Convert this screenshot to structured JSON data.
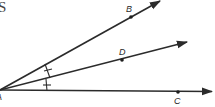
{
  "heading_fragment": "S",
  "vertex": {
    "label": "A",
    "x": 0,
    "y": 90
  },
  "rays": [
    {
      "name": "ray-AB",
      "point": {
        "label": "B",
        "x": 131,
        "y": 17
      },
      "end": {
        "x": 160,
        "y": 0
      }
    },
    {
      "name": "ray-AD",
      "point": {
        "label": "D",
        "x": 122,
        "y": 60
      },
      "end": {
        "x": 187,
        "y": 42
      }
    },
    {
      "name": "ray-AC",
      "point": {
        "label": "C",
        "x": 178,
        "y": 92
      },
      "end": {
        "x": 212,
        "y": 92
      }
    }
  ],
  "congruence_marks": {
    "description": "Single tick marks show angle BAD congruent to angle DAC (AD bisects angle BAC)",
    "count": 2
  },
  "colors": {
    "stroke": "#2b2b2b",
    "background": "#ffffff"
  }
}
